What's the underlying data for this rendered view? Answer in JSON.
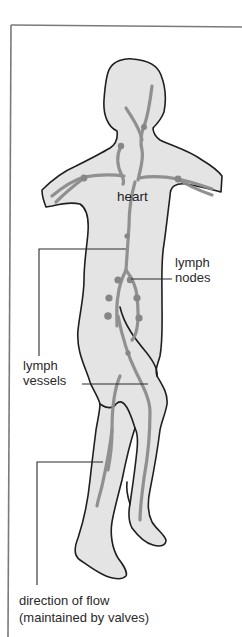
{
  "diagram": {
    "colors": {
      "body_fill": "#e4e4e4",
      "body_outline": "#1f1f1f",
      "vessel": "#8c8c8c",
      "node": "#868686",
      "leader_line": "#2a2a2a",
      "frame": "#777777"
    },
    "labels": {
      "heart": "heart",
      "lymph_nodes": [
        "lymph",
        "nodes"
      ],
      "lymph_vessels": [
        "lymph",
        "vessels"
      ],
      "direction_of_flow": [
        "direction of flow",
        "(maintained by valves)"
      ]
    }
  }
}
